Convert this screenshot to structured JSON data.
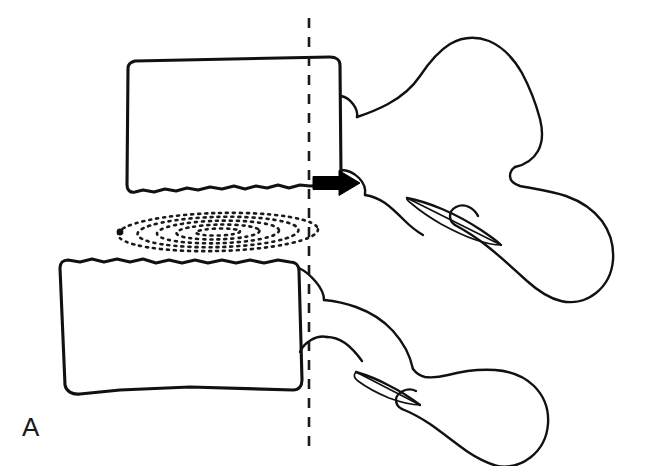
{
  "figure": {
    "panel_label": "A",
    "type": "line-drawing",
    "background_color": "#ffffff",
    "ink_color": "#111111",
    "width": 647,
    "height": 466
  },
  "annotations": {
    "arrow": {
      "name": "retropulsion-arrow",
      "direction": "right",
      "color": "#000000",
      "tip_x": 360,
      "tip_y": 183,
      "tail_x": 313,
      "tail_y": 183
    },
    "reference_line": {
      "name": "posterior-vertebral-body-line",
      "style": "dashed",
      "orientation": "vertical",
      "x": 309,
      "y_start": 18,
      "y_end": 455,
      "color": "#1a1a1a"
    },
    "nucleus_marker": {
      "name": "nucleus-pulposus-dot",
      "x": 120,
      "y": 232,
      "radius": 3.4,
      "color": "#111111"
    }
  },
  "structures": {
    "upper_vertebra": {
      "name": "upper-vertebral-body",
      "body_path": "M 128 68 C 128 64 131 62 135 61 L 330 57 C 336 57 340 60 340 65 L 341 176 C 341 182 338 185 332 185 L 310 186 L 300 185 L 289 188 L 278 185 L 267 188 L 256 186 L 245 189 L 234 186 L 222 189 L 210 187 L 198 190 L 187 188 L 176 191 L 165 189 L 154 192 L 143 190 L 135 192 C 130 193 127 190 127 185 Z",
      "posterior_notch_path": "M 341 96 C 346 97 350 100 353 104 C 356 108 358 112 357 117",
      "pedicle_path": "M 341 170 C 348 170 354 173 359 178 C 364 183 366 189 365 195",
      "lamina_path": "M 357 117 C 366 114 377 110 388 104 C 401 97 412 88 420 76 C 428 64 437 52 450 44 C 462 37 476 36 489 41 C 503 47 514 59 522 73 C 530 88 536 104 540 119 C 543 131 543 142 538 151 C 533 160 524 165 515 167",
      "spinous_path": "M 515 167 C 512 169 510 172 510 176 C 510 181 514 184 520 186 C 535 189 551 191 566 196 C 580 201 593 209 602 221 C 610 232 614 246 613 260 C 612 273 606 285 596 293 C 586 301 573 304 561 301 C 548 298 537 290 527 281 C 514 269 501 257 487 246 C 477 238 466 231 455 225",
      "inferior_facet_path": "M 455 225 C 452 223 450 220 450 216 C 450 212 452 209 456 207 C 460 205 465 205 469 207 C 473 209 476 212 478 216",
      "superior_articular_path": "M 365 195 C 372 196 379 199 385 203 C 392 208 398 214 404 220 C 410 226 416 231 423 235",
      "transverse_process_oval": {
        "cx": 450,
        "cy": 212,
        "rx": 44,
        "ry": 14,
        "rotation": 22
      },
      "tp_path": "M 407 198 C 418 200 430 204 442 209 C 456 215 469 222 481 230 C 490 236 497 241 501 245",
      "tp_path_lower": "M 501 245 C 494 245 485 243 476 240 C 464 236 452 230 441 224 C 429 217 419 210 412 204 C 408 201 406 199 407 198 Z"
    },
    "lower_vertebra": {
      "name": "lower-vertebral-body",
      "body_path": "M 60 268 C 60 263 63 260 68 260 L 80 262 L 92 259 L 104 262 L 117 259 L 130 262 L 143 259 L 156 263 L 169 260 L 182 263 L 195 260 L 208 263 L 222 260 L 236 263 L 250 260 L 264 263 L 278 260 L 290 262 C 296 262 299 266 299 271 L 302 380 C 302 386 299 390 293 390 L 190 387 L 120 390 L 80 394 C 72 395 66 391 65 385 Z",
      "superior_notch_path": "M 299 268 C 305 271 311 276 316 282 C 321 288 324 294 324 300",
      "inferior_notch_path": "M 300 352 C 302 347 306 343 311 340 C 316 337 322 336 327 337",
      "lamina_path": "M 324 300 C 334 301 345 303 356 307 C 370 312 383 320 393 331 C 403 342 410 355 413 369",
      "pedicle_upper_path": "M 327 337 C 333 337 339 339 345 343 C 352 348 357 354 362 361",
      "spinous_path": "M 413 369 C 416 373 420 376 425 377 C 432 378 440 377 448 375 C 463 371 479 369 495 370 C 510 371 524 376 534 386 C 544 396 549 410 548 424 C 547 437 541 449 531 457 C 521 465 509 468 497 466",
      "lower_spinous_under_path": "M 497 466 C 487 463 477 458 468 452 C 455 443 443 433 430 424 C 421 418 412 413 402 409",
      "inf_facet_path": "M 402 409 C 398 407 396 404 396 400 C 396 396 399 393 403 391 C 407 389 412 389 416 391",
      "transverse_process_oval": {
        "cx": 395,
        "cy": 392,
        "rx": 40,
        "ry": 11,
        "rotation": 16
      },
      "tp_path": "M 356 372 C 366 375 377 379 388 385 C 400 391 411 398 420 405",
      "tp_path_lower": "M 420 405 C 411 405 400 402 389 398 C 377 393 366 387 358 381 C 354 378 353 375 356 372 Z"
    },
    "intervertebral_disc": {
      "name": "intervertebral-disc-annulus",
      "center_x": 218,
      "center_y": 232,
      "lamellae_count": 5,
      "dash_pattern": "2 5"
    }
  }
}
